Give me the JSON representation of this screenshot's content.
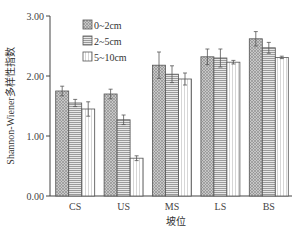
{
  "chart_data": {
    "type": "bar",
    "title": "",
    "xlabel": "坡位",
    "ylabel": "Shannon-Wiener多样性指数",
    "ylim": [
      0,
      3
    ],
    "yticks": [
      "0.00",
      "1.00",
      "2.00",
      "3.00"
    ],
    "categories": [
      "CS",
      "US",
      "MS",
      "LS",
      "BS"
    ],
    "series": [
      {
        "name": "0~2cm",
        "pattern": "crosshatch",
        "values": [
          1.75,
          1.7,
          2.18,
          2.32,
          2.62
        ],
        "errors": [
          0.08,
          0.08,
          0.22,
          0.13,
          0.12
        ]
      },
      {
        "name": "2~5cm",
        "pattern": "horizontal",
        "values": [
          1.55,
          1.27,
          2.03,
          2.3,
          2.47
        ],
        "errors": [
          0.06,
          0.08,
          0.14,
          0.15,
          0.09
        ]
      },
      {
        "name": "5~10cm",
        "pattern": "vertical",
        "values": [
          1.45,
          0.63,
          1.95,
          2.23,
          2.31
        ],
        "errors": [
          0.12,
          0.04,
          0.1,
          0.03,
          0.02
        ]
      }
    ],
    "legend_position": "top-left-inside",
    "grid": false
  }
}
